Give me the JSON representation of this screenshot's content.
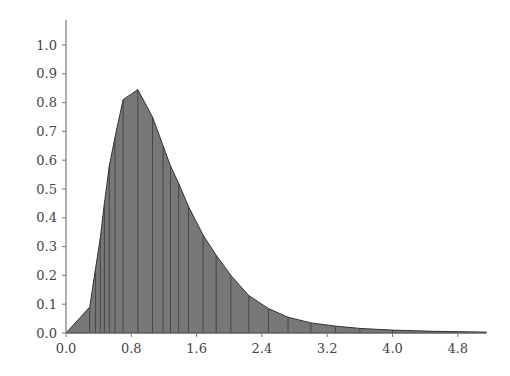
{
  "chart_data": {
    "type": "area",
    "title": "",
    "xlabel": "",
    "ylabel": "",
    "xlim": [
      0.0,
      5.2
    ],
    "ylim": [
      0.0,
      1.08
    ],
    "grid": false,
    "legend": null,
    "x_ticks": [
      "0.0",
      "0.8",
      "1.6",
      "2.4",
      "3.2",
      "4.0",
      "4.8"
    ],
    "y_ticks": [
      "0.0",
      "0.1",
      "0.2",
      "0.3",
      "0.4",
      "0.5",
      "0.6",
      "0.7",
      "0.8",
      "0.9",
      "1.0"
    ],
    "fill_color": "#777777",
    "line_color": "#333333",
    "series": [
      {
        "name": "density",
        "x": [
          0.0,
          0.29,
          0.36,
          0.42,
          0.47,
          0.53,
          0.6,
          0.7,
          0.88,
          1.06,
          1.19,
          1.28,
          1.38,
          1.5,
          1.68,
          1.84,
          2.02,
          2.24,
          2.48,
          2.72,
          3.0,
          3.3,
          3.6,
          4.0,
          4.5,
          5.15
        ],
        "values": [
          0.0,
          0.09,
          0.22,
          0.33,
          0.45,
          0.58,
          0.68,
          0.81,
          0.845,
          0.75,
          0.65,
          0.58,
          0.52,
          0.44,
          0.34,
          0.27,
          0.2,
          0.13,
          0.085,
          0.055,
          0.035,
          0.024,
          0.016,
          0.01,
          0.006,
          0.003
        ]
      }
    ],
    "vertical_lines_at": [
      0.29,
      0.36,
      0.42,
      0.47,
      0.53,
      0.6,
      0.7,
      0.88,
      1.06,
      1.19,
      1.28,
      1.38,
      1.5,
      1.68,
      1.84,
      2.02,
      2.24,
      2.48,
      2.72,
      3.0,
      3.3,
      3.6,
      4.0,
      4.5
    ]
  }
}
